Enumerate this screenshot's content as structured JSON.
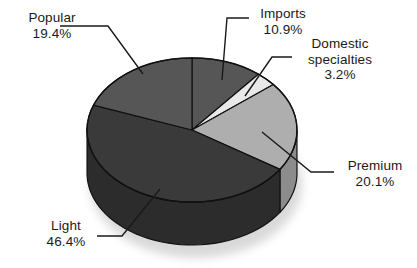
{
  "chart_data": {
    "type": "pie",
    "title": "",
    "subtitle": "",
    "xlabel": "",
    "ylabel": "",
    "legend_position": "none",
    "grid": false,
    "style": "3d-pie",
    "units": "percent",
    "categories": [
      "Imports",
      "Domestic specialties",
      "Premium",
      "Light",
      "Popular"
    ],
    "values": [
      10.9,
      3.2,
      20.1,
      46.4,
      19.4
    ],
    "slices": [
      {
        "label": "Imports",
        "value": 10.9,
        "value_text": "10.9%",
        "color": "#565656",
        "side_color": "#3f3f3f",
        "start_pct": 0.0,
        "end_pct": 10.9
      },
      {
        "label": "Domestic specialties",
        "label_line_1": "Domestic",
        "label_line_2": "specialties",
        "value": 3.2,
        "value_text": "3.2%",
        "color": "#e9e9e9",
        "side_color": "#c2c2c2",
        "start_pct": 10.9,
        "end_pct": 14.1
      },
      {
        "label": "Premium",
        "value": 20.1,
        "value_text": "20.1%",
        "color": "#aeaeae",
        "side_color": "#8c8c8c",
        "start_pct": 14.1,
        "end_pct": 34.2
      },
      {
        "label": "Light",
        "value": 46.4,
        "value_text": "46.4%",
        "color": "#3a3a3a",
        "side_color": "#2c2c2c",
        "start_pct": 34.2,
        "end_pct": 80.6
      },
      {
        "label": "Popular",
        "value": 19.4,
        "value_text": "19.4%",
        "color": "#565656",
        "side_color": "#414141",
        "start_pct": 80.6,
        "end_pct": 100.0
      }
    ],
    "total": 100.0,
    "outline_color": "#111111",
    "background": "#ffffff",
    "text_color": "#1a1a1a"
  },
  "labels": {
    "popular": {
      "name": "Popular",
      "pct": "19.4%"
    },
    "imports": {
      "name": "Imports",
      "pct": "10.9%"
    },
    "domestic": {
      "line1": "Domestic",
      "line2": "specialties",
      "pct": "3.2%"
    },
    "premium": {
      "name": "Premium",
      "pct": "20.1%"
    },
    "light": {
      "name": "Light",
      "pct": "46.4%"
    }
  }
}
